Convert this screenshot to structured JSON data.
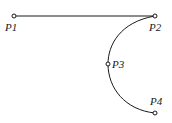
{
  "diagram": {
    "stroke_color": "#1a1a1a",
    "background": "#ffffff",
    "points": [
      {
        "id": "P1",
        "label": "P1",
        "x": 14,
        "y": 16,
        "label_x": 5,
        "label_y": 31
      },
      {
        "id": "P2",
        "label": "P2",
        "x": 155,
        "y": 16,
        "label_x": 149,
        "label_y": 31
      },
      {
        "id": "P3",
        "label": "P3",
        "x": 108,
        "y": 64,
        "label_x": 112,
        "label_y": 68
      },
      {
        "id": "P4",
        "label": "P4",
        "x": 155,
        "y": 113,
        "label_x": 150,
        "label_y": 105
      }
    ],
    "segments": [
      {
        "type": "line",
        "from": "P1",
        "to": "P2"
      },
      {
        "type": "arc",
        "from": "P2",
        "through": "P3",
        "to": "P4"
      }
    ]
  }
}
